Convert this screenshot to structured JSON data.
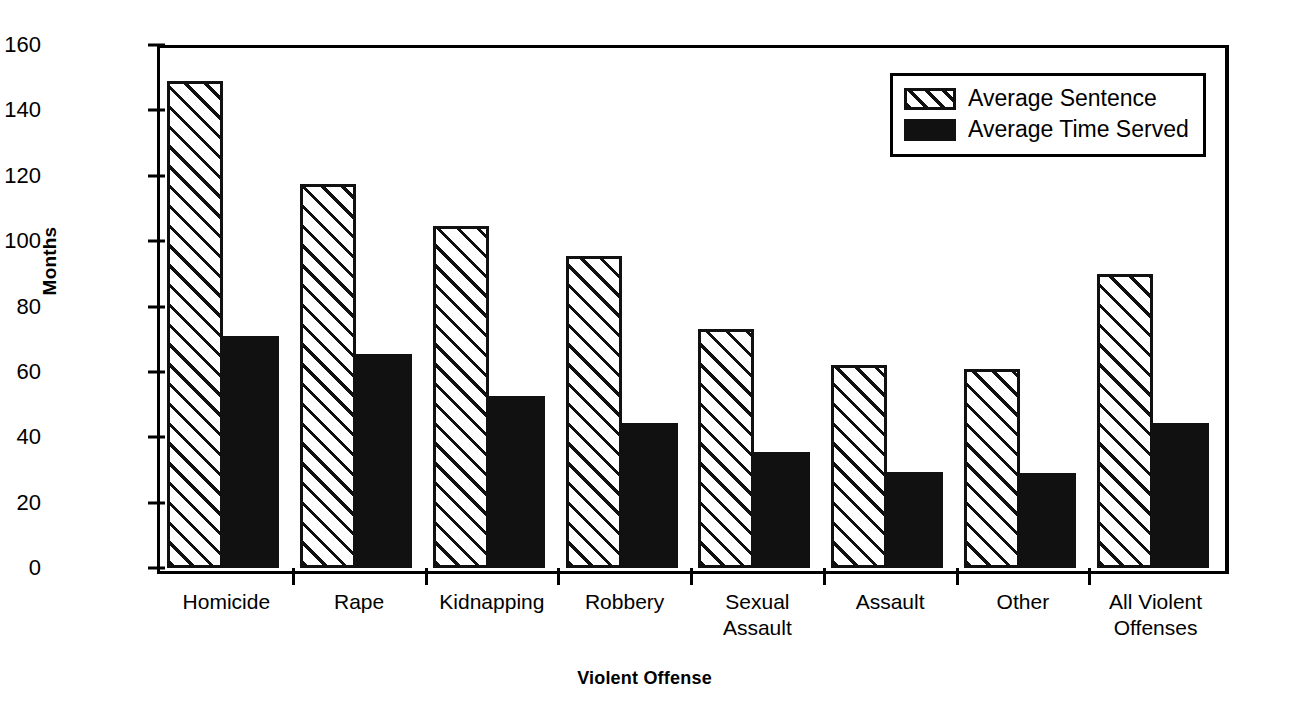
{
  "chart_data": {
    "type": "bar",
    "title": "",
    "xlabel": "Violent Offense",
    "ylabel": "Months",
    "ylim": [
      0,
      160
    ],
    "yticks": [
      0,
      20,
      40,
      60,
      80,
      100,
      120,
      140,
      160
    ],
    "grid": false,
    "legend_position": "top-right",
    "categories": [
      "Homicide",
      "Rape",
      "Kidnapping",
      "Robbery",
      "Sexual Assault",
      "Assault",
      "Other",
      "All Violent Offenses"
    ],
    "category_lines": [
      [
        "Homicide"
      ],
      [
        "Rape"
      ],
      [
        "Kidnapping"
      ],
      [
        "Robbery"
      ],
      [
        "Sexual",
        "Assault"
      ],
      [
        "Assault"
      ],
      [
        "Other"
      ],
      [
        "All Violent",
        "Offenses"
      ]
    ],
    "series": [
      {
        "name": "Average Sentence",
        "pattern": "diagonal-hatch",
        "color": "#111111",
        "values": [
          149,
          117.5,
          104.5,
          95.5,
          73,
          62,
          61,
          90
        ]
      },
      {
        "name": "Average Time Served",
        "pattern": "solid",
        "color": "#111111",
        "values": [
          71,
          65.5,
          52.5,
          44.5,
          35.5,
          29.5,
          29,
          44.5
        ]
      }
    ]
  },
  "legend": {
    "items": [
      {
        "label": "Average Sentence",
        "style": "sentence"
      },
      {
        "label": "Average Time Served",
        "style": "served"
      }
    ]
  },
  "axes": {
    "y_title": "Months",
    "x_title": "Violent Offense",
    "y_tick_labels": [
      "160",
      "140",
      "120",
      "100",
      "80",
      "60",
      "40",
      "20",
      "0"
    ]
  }
}
